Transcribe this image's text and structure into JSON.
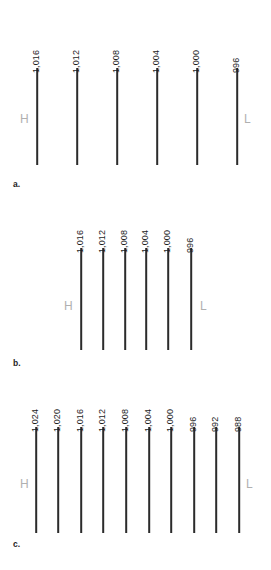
{
  "figure": {
    "line_color": "#2b2b2b",
    "marker_color": "#b0b0b0",
    "background": "#ffffff"
  },
  "chart_data": {
    "type": "line",
    "xlabel": "",
    "ylabel": "",
    "units": "millibars",
    "panels": [
      {
        "caption": "a.",
        "caption_x": 13,
        "caption_y": 180,
        "spacing_description": "wide, evenly spaced isobars",
        "line_top": 68,
        "line_bottom": 165,
        "high_marker": {
          "label": "H",
          "x": 20,
          "y": 113
        },
        "low_marker": {
          "label": "L",
          "x": 244,
          "y": 113
        },
        "isobars": [
          {
            "label": "1,016",
            "x": 37
          },
          {
            "label": "1,012",
            "x": 77
          },
          {
            "label": "1,008",
            "x": 117
          },
          {
            "label": "1,004",
            "x": 157
          },
          {
            "label": "1,000",
            "x": 197
          },
          {
            "label": "996",
            "x": 237
          }
        ]
      },
      {
        "caption": "b.",
        "caption_x": 13,
        "caption_y": 359,
        "spacing_description": "narrow, evenly spaced isobars clustered at centre",
        "line_top": 248,
        "line_bottom": 350,
        "high_marker": {
          "label": "H",
          "x": 64,
          "y": 300
        },
        "low_marker": {
          "label": "L",
          "x": 200,
          "y": 300
        },
        "isobars": [
          {
            "label": "1,016",
            "x": 81
          },
          {
            "label": "1,012",
            "x": 103
          },
          {
            "label": "1,008",
            "x": 125
          },
          {
            "label": "1,004",
            "x": 146
          },
          {
            "label": "1,000",
            "x": 168
          },
          {
            "label": "996",
            "x": 191
          }
        ]
      },
      {
        "caption": "c.",
        "caption_x": 13,
        "caption_y": 540,
        "spacing_description": "ten evenly spaced isobars spanning full width",
        "line_top": 427,
        "line_bottom": 533,
        "high_marker": {
          "label": "H",
          "x": 20,
          "y": 478
        },
        "low_marker": {
          "label": "L",
          "x": 246,
          "y": 478
        },
        "isobars": [
          {
            "label": "1,024",
            "x": 36
          },
          {
            "label": "1,020",
            "x": 58
          },
          {
            "label": "1,016",
            "x": 81
          },
          {
            "label": "1,012",
            "x": 103
          },
          {
            "label": "1,008",
            "x": 126
          },
          {
            "label": "1,004",
            "x": 149
          },
          {
            "label": "1,000",
            "x": 171
          },
          {
            "label": "996",
            "x": 194
          },
          {
            "label": "992",
            "x": 216
          },
          {
            "label": "988",
            "x": 239
          }
        ]
      }
    ]
  }
}
